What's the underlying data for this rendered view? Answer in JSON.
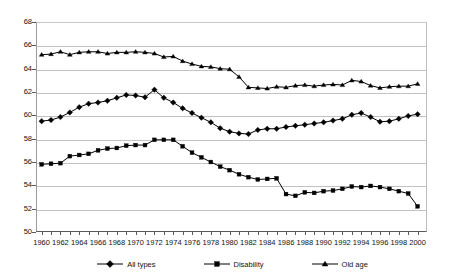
{
  "chart_data": {
    "type": "line",
    "title": "",
    "subtitle": "",
    "xlabel": "",
    "ylabel": "",
    "xlim": [
      1959.4,
      2001.0
    ],
    "ylim": [
      50,
      68
    ],
    "grid": true,
    "legend_position": "bottom-center",
    "x": [
      1960,
      1961,
      1962,
      1963,
      1964,
      1965,
      1966,
      1967,
      1968,
      1969,
      1970,
      1971,
      1972,
      1973,
      1974,
      1975,
      1976,
      1977,
      1978,
      1979,
      1980,
      1981,
      1982,
      1983,
      1984,
      1985,
      1986,
      1987,
      1988,
      1989,
      1990,
      1991,
      1992,
      1993,
      1994,
      1995,
      1996,
      1997,
      1998,
      1999,
      2000
    ],
    "y_ticks": [
      50,
      52,
      54,
      56,
      58,
      60,
      62,
      64,
      66,
      68
    ],
    "x_tick_labels": [
      "1960",
      "1962",
      "1964",
      "1966",
      "1968",
      "1970",
      "1972",
      "1974",
      "1976",
      "1978",
      "1980",
      "1982",
      "1984",
      "1986",
      "1988",
      "1990",
      "1992",
      "1994",
      "1996",
      "1998",
      "2000"
    ],
    "series": [
      {
        "name": "All types",
        "marker": "diamond",
        "color": "#000000",
        "values": [
          59.5,
          59.6,
          59.85,
          60.25,
          60.7,
          61.0,
          61.1,
          61.25,
          61.5,
          61.75,
          61.7,
          61.55,
          62.2,
          61.5,
          61.1,
          60.6,
          60.2,
          59.8,
          59.4,
          58.9,
          58.6,
          58.45,
          58.4,
          58.75,
          58.85,
          58.85,
          59.0,
          59.1,
          59.2,
          59.3,
          59.4,
          59.55,
          59.7,
          60.05,
          60.2,
          59.85,
          59.45,
          59.5,
          59.7,
          59.95,
          60.1
        ]
      },
      {
        "name": "Disability",
        "marker": "square",
        "color": "#000000",
        "values": [
          55.8,
          55.85,
          55.9,
          56.5,
          56.6,
          56.7,
          57.0,
          57.15,
          57.2,
          57.4,
          57.45,
          57.45,
          57.9,
          57.9,
          57.9,
          57.35,
          56.8,
          56.4,
          56.0,
          55.6,
          55.3,
          54.95,
          54.7,
          54.5,
          54.55,
          54.6,
          53.25,
          53.1,
          53.4,
          53.35,
          53.5,
          53.55,
          53.7,
          53.9,
          53.85,
          53.95,
          53.85,
          53.7,
          53.5,
          53.3,
          52.2
        ]
      },
      {
        "name": "Old age",
        "marker": "triangle",
        "color": "#000000",
        "values": [
          65.2,
          65.25,
          65.45,
          65.2,
          65.4,
          65.45,
          65.45,
          65.3,
          65.4,
          65.4,
          65.45,
          65.4,
          65.3,
          65.0,
          65.05,
          64.65,
          64.4,
          64.2,
          64.15,
          64.0,
          63.95,
          63.3,
          62.4,
          62.35,
          62.3,
          62.45,
          62.4,
          62.55,
          62.6,
          62.5,
          62.6,
          62.65,
          62.6,
          63.0,
          62.9,
          62.55,
          62.35,
          62.45,
          62.5,
          62.5,
          62.7
        ]
      }
    ]
  },
  "legend": {
    "items": [
      {
        "label": "All types",
        "marker": "diamond-marker"
      },
      {
        "label": "Disability",
        "marker": "square-marker"
      },
      {
        "label": "Old age",
        "marker": "triangle-marker"
      }
    ]
  }
}
